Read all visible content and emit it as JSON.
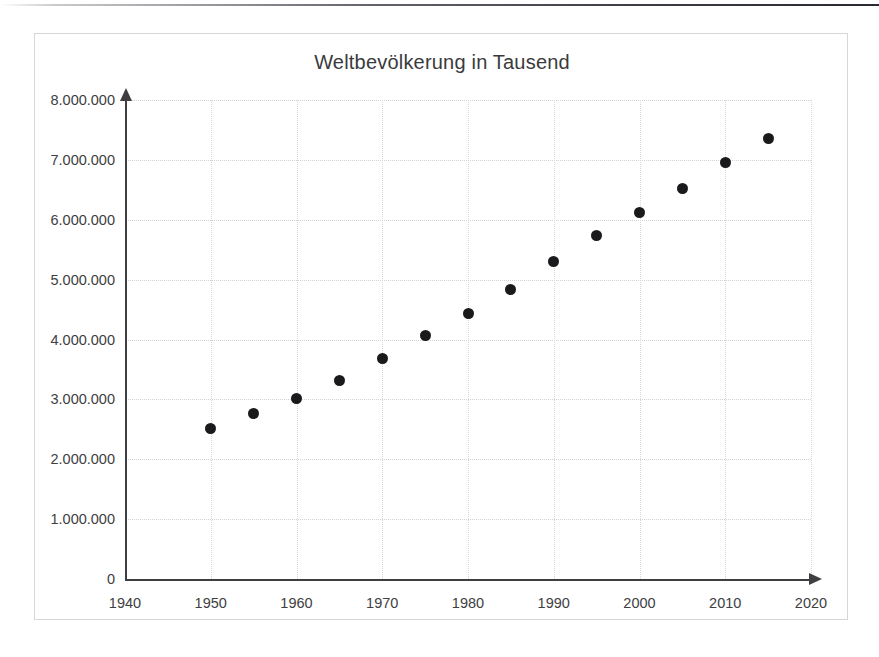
{
  "chart_data": {
    "type": "scatter",
    "title": "Weltbevölkerung in Tausend",
    "xlabel": "",
    "ylabel": "",
    "xlim": [
      1940,
      2020
    ],
    "ylim": [
      0,
      8000000
    ],
    "grid": true,
    "legend": "none",
    "x_ticks": [
      1940,
      1950,
      1960,
      1970,
      1980,
      1990,
      2000,
      2010,
      2020
    ],
    "x_tick_labels": [
      "1940",
      "1950",
      "1960",
      "1970",
      "1980",
      "1990",
      "2000",
      "2010",
      "2020"
    ],
    "y_ticks": [
      0,
      1000000,
      2000000,
      3000000,
      4000000,
      5000000,
      6000000,
      7000000,
      8000000
    ],
    "y_tick_labels": [
      "0",
      "1.000.000",
      "2.000.000",
      "3.000.000",
      "4.000.000",
      "5.000.000",
      "6.000.000",
      "7.000.000",
      "8.000.000"
    ],
    "x": [
      1950,
      1955,
      1960,
      1965,
      1970,
      1975,
      1980,
      1985,
      1990,
      1995,
      2000,
      2005,
      2010,
      2015
    ],
    "values": [
      2520000,
      2760000,
      3020000,
      3320000,
      3680000,
      4060000,
      4430000,
      4830000,
      5310000,
      5730000,
      6120000,
      6520000,
      6950000,
      7350000
    ],
    "points": [
      {
        "x": 1950,
        "y": 2520000
      },
      {
        "x": 1955,
        "y": 2760000
      },
      {
        "x": 1960,
        "y": 3020000
      },
      {
        "x": 1965,
        "y": 3320000
      },
      {
        "x": 1970,
        "y": 3680000
      },
      {
        "x": 1975,
        "y": 4060000
      },
      {
        "x": 1980,
        "y": 4430000
      },
      {
        "x": 1985,
        "y": 4830000
      },
      {
        "x": 1990,
        "y": 5310000
      },
      {
        "x": 1995,
        "y": 5730000
      },
      {
        "x": 2000,
        "y": 6120000
      },
      {
        "x": 2005,
        "y": 6520000
      },
      {
        "x": 2010,
        "y": 6950000
      },
      {
        "x": 2015,
        "y": 7350000
      }
    ],
    "marker_color": "#1a1a1c",
    "axis_color": "#3f3f41",
    "grid_color": "#d2d2d4",
    "frame_color": "#d7d7d9",
    "background_color": "#ffffff"
  }
}
